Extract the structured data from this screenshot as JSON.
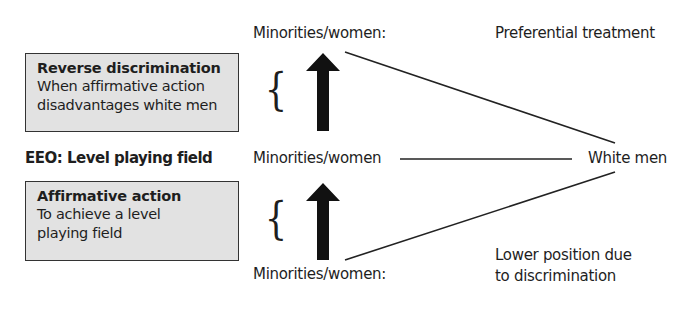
{
  "reverse_box": {
    "title": "Reverse discrimination",
    "line1": "When affirmative action",
    "line2": "disadvantages white men"
  },
  "affirmative_box": {
    "title": "Affirmative action",
    "line1": "To achieve a level",
    "line2": "playing field"
  },
  "eeo_label": "EEO: Level playing field",
  "minorities_top": "Minorities/women:",
  "minorities_mid": "Minorities/women",
  "minorities_bottom": "Minorities/women:",
  "white_men": "White men",
  "preferential": "Preferential treatment",
  "lower_line1": "Lower position due",
  "lower_line2": "to discrimination",
  "brace_glyph": "{",
  "colors": {
    "box_fill": "#e2e2e2",
    "ink": "#1e1e1e"
  }
}
